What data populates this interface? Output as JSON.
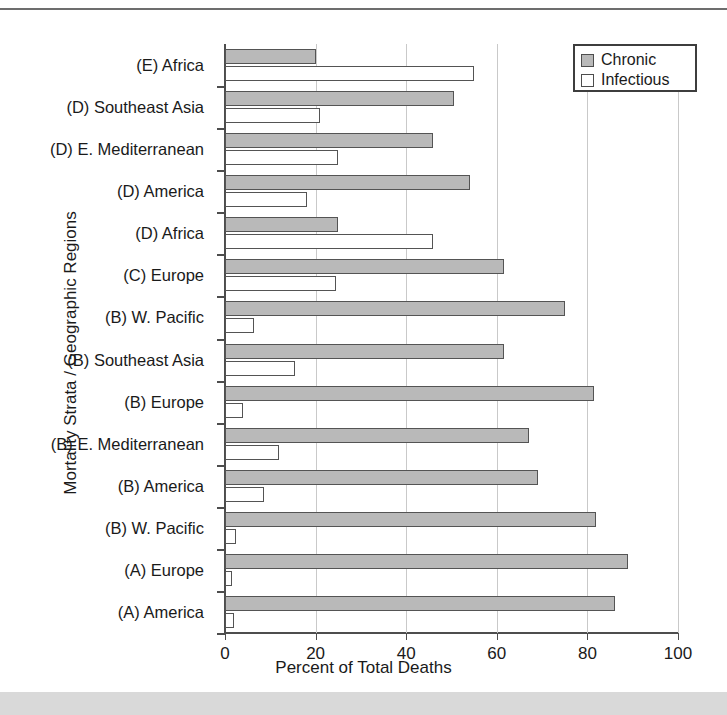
{
  "figure": {
    "x_axis_title": "Percent of Total Deaths",
    "y_axis_title": "Mortality Strata / Geographic Regions"
  },
  "legend": {
    "position": "top-right",
    "entries": [
      {
        "label": "Chronic",
        "swatch": "filled-gray-square",
        "color": "#b9b9b9"
      },
      {
        "label": "Infectious",
        "swatch": "empty-white-square",
        "color": "#ffffff"
      }
    ]
  },
  "chart_data": {
    "type": "bar",
    "orientation": "horizontal",
    "title": "",
    "xlabel": "Percent of Total Deaths",
    "ylabel": "Mortality Strata / Geographic Regions",
    "xlim": [
      0,
      100
    ],
    "xticks": [
      0,
      20,
      40,
      60,
      80,
      100
    ],
    "xtick_labels": [
      "0",
      "20",
      "40",
      "60",
      "80",
      "100"
    ],
    "grid": "vertical",
    "categories": [
      "(E) Africa",
      "(D) Southeast Asia",
      "(D) E. Mediterranean",
      "(D) America",
      "(D) Africa",
      "(C) Europe",
      "(B) W. Pacific",
      "(B) Southeast Asia",
      "(B) Europe",
      "(B) E. Mediterranean",
      "(B) America",
      "(B) W. Pacific",
      "(A) Europe",
      "(A) America"
    ],
    "series": [
      {
        "name": "Chronic",
        "color": "#b9b9b9",
        "values": [
          20,
          50.5,
          46,
          54,
          25,
          61.5,
          75,
          61.5,
          81.5,
          67,
          69,
          82,
          89,
          86
        ]
      },
      {
        "name": "Infectious",
        "color": "#ffffff",
        "values": [
          55,
          21,
          25,
          18,
          46,
          24.5,
          6.5,
          15.5,
          4,
          12,
          8.5,
          2.5,
          1.5,
          2
        ]
      }
    ]
  },
  "colors": {
    "chronic_fill": "#b9b9b9",
    "infectious_fill": "#ffffff",
    "bar_outline": "#545454",
    "axis": "#4d4d4d",
    "gridline": "#c9c9c9",
    "bottom_strip": "#d9d9d9",
    "top_rule": "#6d6d6d"
  }
}
